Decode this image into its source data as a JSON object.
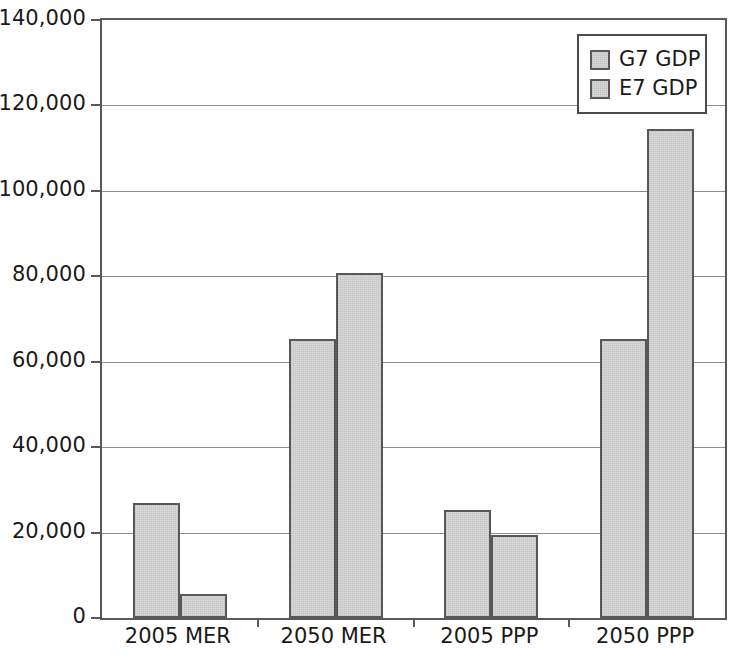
{
  "chart_data": {
    "type": "bar",
    "title": "",
    "subtitle": "",
    "xlabel": "",
    "ylabel": "",
    "categories": [
      "2005 MER",
      "2050 MER",
      "2005 PPP",
      "2050 PPP"
    ],
    "series": [
      {
        "name": "G7 GDP",
        "values": [
          26900,
          65300,
          25300,
          65300
        ],
        "color": "#d9d9d9"
      },
      {
        "name": "E7 GDP",
        "values": [
          5600,
          80700,
          19400,
          114500
        ],
        "color": "#d9d9d9"
      }
    ],
    "ylim": [
      0,
      140000
    ],
    "ytick_values": [
      0,
      20000,
      40000,
      60000,
      80000,
      100000,
      120000,
      140000
    ],
    "ytick_labels": [
      "0",
      "20,000",
      "40,000",
      "60,000",
      "80,000",
      "100,000",
      "120,000",
      "140,000"
    ],
    "grid": true,
    "grid_axis": "y",
    "legend_position": "top-right",
    "legend_entries": [
      "G7 GDP",
      "E7 GDP"
    ],
    "annotations": [],
    "axis_color": "#58585a",
    "grid_color": "#8d8d8f",
    "bar_edge_color": "#58585a",
    "background_color": "#ffffff"
  }
}
